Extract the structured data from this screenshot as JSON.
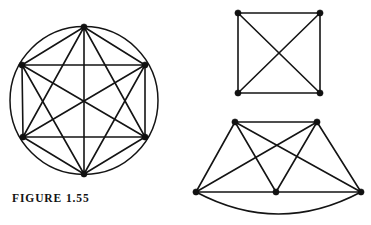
{
  "figure": {
    "caption": "FIGURE 1.55",
    "width": 371,
    "height": 225,
    "background_color": "#ffffff",
    "ink_color": "#141414",
    "vertex_color": "#111111",
    "edge_width": 1.6,
    "circle_width": 1.5,
    "vertex_radius": 3.1
  },
  "graphs": [
    {
      "name": "complete-graph-k6-in-circle",
      "type": "complete",
      "order": 6,
      "size": 15,
      "enclosing_circle": {
        "cx": 84,
        "cy": 100.5,
        "r": 74
      },
      "vertices": [
        {
          "id": "v1",
          "label": "top",
          "x": 84,
          "y": 27
        },
        {
          "id": "v2",
          "label": "upper-right",
          "x": 145,
          "y": 65
        },
        {
          "id": "v3",
          "label": "lower-right",
          "x": 145,
          "y": 137
        },
        {
          "id": "v4",
          "label": "bottom",
          "x": 84,
          "y": 174
        },
        {
          "id": "v5",
          "label": "lower-left",
          "x": 23,
          "y": 137
        },
        {
          "id": "v6",
          "label": "upper-left",
          "x": 22,
          "y": 65
        }
      ],
      "edges": [
        [
          "v1",
          "v2"
        ],
        [
          "v1",
          "v3"
        ],
        [
          "v1",
          "v4"
        ],
        [
          "v1",
          "v5"
        ],
        [
          "v1",
          "v6"
        ],
        [
          "v2",
          "v3"
        ],
        [
          "v2",
          "v4"
        ],
        [
          "v2",
          "v5"
        ],
        [
          "v2",
          "v6"
        ],
        [
          "v3",
          "v4"
        ],
        [
          "v3",
          "v5"
        ],
        [
          "v3",
          "v6"
        ],
        [
          "v4",
          "v5"
        ],
        [
          "v4",
          "v6"
        ],
        [
          "v5",
          "v6"
        ]
      ],
      "curved_edges": []
    },
    {
      "name": "complete-graph-k4-square",
      "type": "complete",
      "order": 4,
      "size": 6,
      "enclosing_circle": null,
      "vertices": [
        {
          "id": "u1",
          "label": "top-left",
          "x": 238,
          "y": 13
        },
        {
          "id": "u2",
          "label": "top-right",
          "x": 320,
          "y": 13
        },
        {
          "id": "u3",
          "label": "bottom-right",
          "x": 320,
          "y": 93
        },
        {
          "id": "u4",
          "label": "bottom-left",
          "x": 238,
          "y": 93
        }
      ],
      "edges": [
        [
          "u1",
          "u2"
        ],
        [
          "u1",
          "u3"
        ],
        [
          "u1",
          "u4"
        ],
        [
          "u2",
          "u3"
        ],
        [
          "u2",
          "u4"
        ],
        [
          "u3",
          "u4"
        ]
      ],
      "curved_edges": []
    },
    {
      "name": "complete-graph-k5",
      "type": "complete",
      "order": 5,
      "size": 10,
      "enclosing_circle": null,
      "vertices": [
        {
          "id": "w1",
          "label": "top-left",
          "x": 235,
          "y": 122
        },
        {
          "id": "w2",
          "label": "top-right",
          "x": 317,
          "y": 122
        },
        {
          "id": "w3",
          "label": "right",
          "x": 361,
          "y": 192
        },
        {
          "id": "w4",
          "label": "bottom-middle",
          "x": 276,
          "y": 192
        },
        {
          "id": "w5",
          "label": "left",
          "x": 196,
          "y": 192
        }
      ],
      "edges": [
        [
          "w1",
          "w2"
        ],
        [
          "w1",
          "w3"
        ],
        [
          "w1",
          "w4"
        ],
        [
          "w1",
          "w5"
        ],
        [
          "w2",
          "w3"
        ],
        [
          "w2",
          "w4"
        ],
        [
          "w2",
          "w5"
        ],
        [
          "w3",
          "w4"
        ],
        [
          "w4",
          "w5"
        ]
      ],
      "curved_edges": [
        {
          "from": "w5",
          "to": "w3",
          "sag": 22
        }
      ]
    }
  ]
}
